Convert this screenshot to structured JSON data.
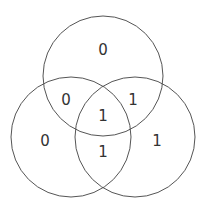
{
  "diagram": {
    "type": "venn-3",
    "stroke_color": "#555555",
    "text_color": "#333333",
    "circles": [
      {
        "id": "top",
        "cx": 103,
        "cy": 76,
        "r": 60
      },
      {
        "id": "left",
        "cx": 71,
        "cy": 137,
        "r": 60
      },
      {
        "id": "right",
        "cx": 135,
        "cy": 137,
        "r": 60
      }
    ],
    "regions": {
      "top_only": "0",
      "left_only": "0",
      "right_only": "1",
      "top_left": "0",
      "top_right": "1",
      "left_right": "1",
      "all_three": "1"
    }
  }
}
